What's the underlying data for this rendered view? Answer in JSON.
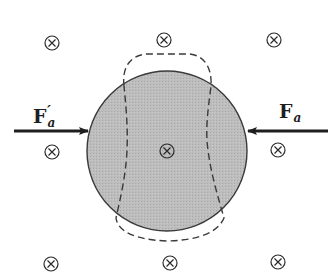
{
  "diagram": {
    "colors": {
      "sphere_fill": "#bdbdbd",
      "stroke": "#2a2a2a",
      "background": "#ffffff"
    },
    "sphere": {
      "cx": 167,
      "cy": 151,
      "r": 80
    },
    "field_symbols": {
      "meaning": "magnetic field into page",
      "glyph": "⊗",
      "positions": [
        {
          "x": 52,
          "y": 43
        },
        {
          "x": 164,
          "y": 40
        },
        {
          "x": 274,
          "y": 40
        },
        {
          "x": 52,
          "y": 152
        },
        {
          "x": 167,
          "y": 151
        },
        {
          "x": 278,
          "y": 150
        },
        {
          "x": 51,
          "y": 264
        },
        {
          "x": 170,
          "y": 263
        },
        {
          "x": 278,
          "y": 262
        }
      ]
    },
    "forces": {
      "left": {
        "label": "F",
        "subscript": "a",
        "prime": "′",
        "direction": "right",
        "x1": 14,
        "x2": 88,
        "y": 131
      },
      "right": {
        "label": "F",
        "subscript": "a",
        "direction": "left",
        "x1": 328,
        "x2": 248,
        "y": 131
      }
    }
  }
}
